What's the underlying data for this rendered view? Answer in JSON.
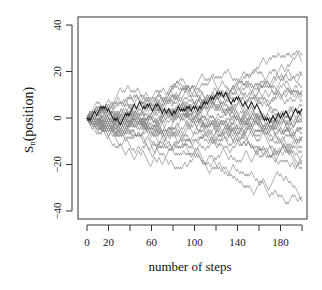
{
  "chart_data": {
    "type": "line",
    "title": "",
    "xlabel": "number of steps",
    "ylabel": "Sn(position)",
    "ylabel_main": "S",
    "ylabel_sub": "n",
    "ylabel_rest": "(position)",
    "xlim": [
      0,
      200
    ],
    "ylim": [
      -40,
      40
    ],
    "x_ticks": [
      0,
      20,
      40,
      60,
      80,
      100,
      120,
      140,
      160,
      180,
      200
    ],
    "x_tick_labels": [
      "0",
      "20",
      "",
      "60",
      "",
      "100",
      "",
      "140",
      "",
      "180",
      ""
    ],
    "y_ticks": [
      40,
      20,
      0,
      -20,
      -40
    ],
    "y_tick_labels": [
      "40",
      "20",
      "0",
      "-20",
      "-40"
    ],
    "grid": false,
    "legend": null,
    "n_walks": 30,
    "n_steps": 200,
    "step_size": 1,
    "start_value": 0,
    "approx_final_values": [
      28,
      24,
      20,
      17,
      14,
      12,
      10,
      9,
      7,
      5,
      4,
      3,
      1,
      0,
      -1,
      -2,
      -4,
      -5,
      -6,
      -8,
      -9,
      -11,
      -12,
      -14,
      -16,
      -18,
      -20,
      -22,
      -34,
      -36
    ],
    "highlighted_walk_final_value": 4,
    "line_color": "#8a8a8a",
    "highlight_color": "#222222"
  }
}
